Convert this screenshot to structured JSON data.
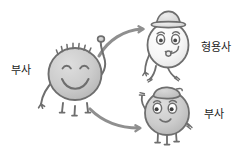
{
  "diagram": {
    "background_color": "#ffffff",
    "ink_color": "#6e6e6e",
    "body_fill_gray": "#c9c9c9",
    "body_fill_light": "#f2f2f2",
    "arrow_color": "#8a8a8a",
    "labels": {
      "source": "부사",
      "target_top": "형용사",
      "target_bottom": "부사"
    },
    "characters": [
      {
        "id": "source-blob",
        "name": "부사",
        "tone": "gray",
        "expression": "closed-happy-eyes-wide-smile",
        "features": "spiky-hair, raised-right-arm, left-arm-down, three-legs"
      },
      {
        "id": "adjective-blob",
        "name": "형용사",
        "tone": "light",
        "expression": "open-eyes-eyebrows-small-mouth",
        "features": "bowler-hat, pipe-curl, two-walking-legs, left-arm-down"
      },
      {
        "id": "adverb-blob",
        "name": "부사",
        "tone": "gray",
        "expression": "open-eyes-eyebrows-small-smile",
        "features": "flat-beret-cap, raised-left-arm, side-arm, three-legs"
      }
    ],
    "arrows": [
      {
        "id": "arrow-to-adjective",
        "from": "source-blob",
        "to": "adjective-blob",
        "direction": "up-right"
      },
      {
        "id": "arrow-to-adverb",
        "from": "source-blob",
        "to": "adverb-blob",
        "direction": "down-right"
      }
    ]
  }
}
